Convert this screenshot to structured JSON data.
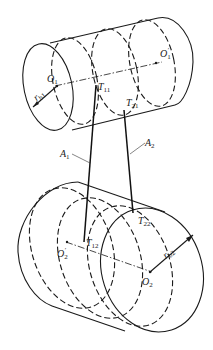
{
  "figure": {
    "type": "engineering-diagram",
    "labels": {
      "O1": {
        "main": "O",
        "sub": "1"
      },
      "O1prime": {
        "main": "O",
        "sub": "1",
        "prime": "′"
      },
      "rb1": {
        "main": "r",
        "sub": "b1"
      },
      "T11": {
        "main": "T",
        "sub": "11"
      },
      "T21": {
        "main": "T",
        "sub": "21"
      },
      "A1": {
        "main": "A",
        "sub": "1"
      },
      "A2": {
        "main": "A",
        "sub": "2"
      },
      "T12": {
        "main": "T",
        "sub": "12"
      },
      "T22": {
        "main": "T",
        "sub": "22"
      },
      "O2prime": {
        "main": "O",
        "sub": "2",
        "prime": "′"
      },
      "O2": {
        "main": "O",
        "sub": "2"
      },
      "rb2": {
        "main": "r",
        "sub": "b2"
      }
    },
    "colors": {
      "line": "#1a1a1a",
      "background": "#ffffff"
    }
  }
}
